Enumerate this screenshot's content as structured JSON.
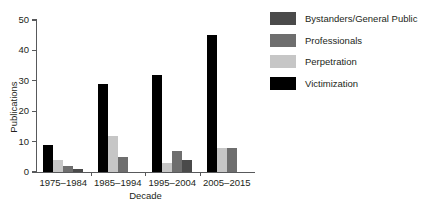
{
  "chart_data": {
    "type": "bar",
    "title": "",
    "xlabel": "Decade",
    "ylabel": "Publications",
    "categories": [
      "1975–1984",
      "1985–1994",
      "1995–2004",
      "2005–2015"
    ],
    "ylim": [
      0,
      50
    ],
    "yticks": [
      0,
      10,
      20,
      30,
      40,
      50
    ],
    "ytick_labels": [
      "0",
      "10",
      "20",
      "30",
      "40",
      "50"
    ],
    "grid": false,
    "legend_position": "right",
    "series": [
      {
        "name": "Bystanders/General Public",
        "color": "#4a4a4a",
        "values": [
          1,
          0,
          4,
          0
        ]
      },
      {
        "name": "Professionals",
        "color": "#6e6e6e",
        "values": [
          2,
          5,
          7,
          8
        ]
      },
      {
        "name": "Perpetration",
        "color": "#c6c6c6",
        "values": [
          4,
          12,
          3,
          8
        ]
      },
      {
        "name": "Victimization",
        "color": "#000000",
        "values": [
          9,
          29,
          32,
          45
        ]
      }
    ],
    "bar_draw_order": [
      "Victimization",
      "Perpetration",
      "Professionals",
      "Bystanders/General Public"
    ]
  },
  "legend": {
    "items": [
      {
        "label": "Bystanders/General Public",
        "color": "#4a4a4a"
      },
      {
        "label": "Professionals",
        "color": "#6e6e6e"
      },
      {
        "label": "Perpetration",
        "color": "#c6c6c6"
      },
      {
        "label": "Victimization",
        "color": "#000000"
      }
    ]
  }
}
